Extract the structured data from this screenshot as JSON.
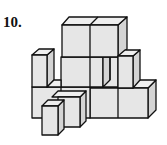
{
  "problem": {
    "number": "10.",
    "figure": "isometric-cube-structure"
  }
}
